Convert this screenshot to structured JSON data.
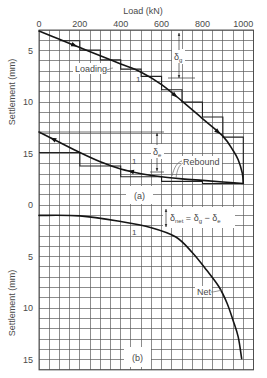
{
  "chart_data": {
    "type": "line",
    "title": "",
    "xlabel": "Load (kN)",
    "xlim": [
      0,
      1050
    ],
    "x_ticks": [
      0,
      200,
      400,
      600,
      800,
      1000
    ],
    "x_tick_labels": [
      "0",
      "200",
      "400",
      "600",
      "800",
      "1000"
    ],
    "grid": true,
    "grid_step": {
      "x": 50,
      "y": 1
    },
    "legend": null,
    "panels": [
      {
        "id": "a",
        "label": "(a)",
        "ylabel": "Settlement (mm)",
        "ylim": [
          3,
          20
        ],
        "y_inverted": true,
        "y_ticks": [
          5,
          10,
          15
        ],
        "y_tick_labels": [
          "5",
          "10",
          "15"
        ],
        "series": [
          {
            "name": "Loading",
            "direction": "increasing",
            "arrow_at": [
              173,
              666,
              876
            ],
            "points": [
              [
                0,
                3.1
              ],
              [
                100,
                3.9
              ],
              [
                200,
                4.7
              ],
              [
                300,
                5.5
              ],
              [
                400,
                6.3
              ],
              [
                500,
                7.1
              ],
              [
                600,
                8.3
              ],
              [
                700,
                9.9
              ],
              [
                800,
                11.6
              ],
              [
                900,
                13.3
              ],
              [
                950,
                14.7
              ],
              [
                975,
                15.6
              ],
              [
                995,
                16.9
              ],
              [
                1000,
                17.9
              ]
            ]
          },
          {
            "name": "Rebound",
            "direction": "decreasing",
            "arrow_at": [
              69,
              450
            ],
            "points": [
              [
                0,
                12.9
              ],
              [
                100,
                13.9
              ],
              [
                200,
                14.9
              ],
              [
                300,
                15.8
              ],
              [
                400,
                16.5
              ],
              [
                500,
                16.95
              ],
              [
                600,
                17.25
              ],
              [
                700,
                17.45
              ],
              [
                800,
                17.6
              ],
              [
                900,
                17.75
              ],
              [
                1000,
                17.9
              ]
            ]
          }
        ],
        "step_series": [
          {
            "name": "Loading increments",
            "points": [
              [
                100,
                4.05
              ],
              [
                200,
                4.05
              ],
              [
                200,
                4.95
              ],
              [
                300,
                4.95
              ],
              [
                300,
                5.9
              ],
              [
                400,
                5.9
              ],
              [
                400,
                6.8
              ],
              [
                500,
                6.8
              ],
              [
                500,
                7.5
              ],
              [
                600,
                7.5
              ],
              [
                600,
                8.8
              ],
              [
                700,
                8.8
              ],
              [
                700,
                10.0
              ],
              [
                800,
                10.0
              ],
              [
                800,
                11.45
              ],
              [
                900,
                11.45
              ],
              [
                900,
                13.4
              ],
              [
                1000,
                13.4
              ],
              [
                1000,
                17.9
              ]
            ]
          },
          {
            "name": "Rebound decrements",
            "points": [
              [
                0,
                14.9
              ],
              [
                200,
                14.9
              ],
              [
                200,
                16.2
              ],
              [
                400,
                16.2
              ],
              [
                400,
                17.25
              ],
              [
                600,
                17.25
              ],
              [
                600,
                17.7
              ],
              [
                800,
                17.7
              ],
              [
                800,
                17.9
              ],
              [
                1000,
                17.9
              ]
            ]
          }
        ]
      },
      {
        "id": "b",
        "label": "(b)",
        "ylabel": "Settlement (mm)",
        "ylim": [
          0,
          16
        ],
        "y_inverted": true,
        "y_ticks": [
          0,
          5,
          10,
          15
        ],
        "y_tick_labels": [
          "0",
          "5",
          "10",
          "15"
        ],
        "series": [
          {
            "name": "Net",
            "direction": "increasing",
            "arrow_at": [],
            "points": [
              [
                0,
                1.0
              ],
              [
                200,
                1.05
              ],
              [
                400,
                1.6
              ],
              [
                550,
                2.2
              ],
              [
                670,
                3.1
              ],
              [
                750,
                4.6
              ],
              [
                820,
                6.3
              ],
              [
                880,
                7.9
              ],
              [
                920,
                9.5
              ],
              [
                950,
                11.2
              ],
              [
                975,
                12.8
              ],
              [
                992,
                14.9
              ]
            ]
          }
        ],
        "step_series": []
      }
    ]
  },
  "annotations": {
    "xlabel": "Load (kN)",
    "ylabel_a": "Settlement (mm)",
    "ylabel_b": "Settlement (mm)",
    "loading_label": "Loading",
    "rebound_label": "Rebound",
    "net_label": "Net",
    "panel_a_label": "(a)",
    "panel_b_label": "(b)",
    "delta_g": {
      "symbol": "δ",
      "sub": "g"
    },
    "delta_e": {
      "symbol": "δ",
      "sub": "e"
    },
    "delta_net": {
      "symbol": "δ",
      "sub": "net",
      "eq": " = ",
      "g_symbol": "δ",
      "g_sub": "g",
      "minus": " − ",
      "e_symbol": "δ",
      "e_sub": "e"
    },
    "slope_marks": [
      "1",
      "1",
      "1"
    ]
  }
}
